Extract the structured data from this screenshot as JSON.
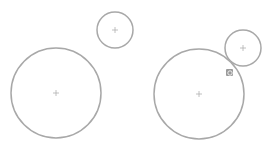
{
  "canvas": {
    "width": 273,
    "height": 154,
    "background": "#ffffff"
  },
  "style": {
    "stroke": "#a8a8a8",
    "center_mark": "#b0b0b0",
    "constraint_icon": "#9a9a9a"
  },
  "panels": [
    {
      "label": "before",
      "circles": [
        {
          "name": "large-circle",
          "cx": 56,
          "cy": 93,
          "r": 45
        },
        {
          "name": "small-circle",
          "cx": 115,
          "cy": 30,
          "r": 18
        }
      ]
    },
    {
      "label": "after-tangent",
      "circles": [
        {
          "name": "large-circle",
          "cx": 199,
          "cy": 94,
          "r": 45
        },
        {
          "name": "small-circle",
          "cx": 243,
          "cy": 48,
          "r": 18
        }
      ],
      "constraint": {
        "type": "tangent",
        "icon": "tangent-constraint-icon",
        "x": 229,
        "y": 73
      }
    }
  ]
}
